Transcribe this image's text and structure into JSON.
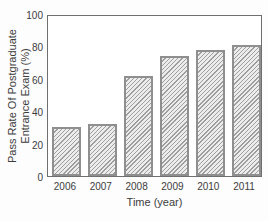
{
  "chart_data": {
    "type": "bar",
    "title": "",
    "categories": [
      "2006",
      "2007",
      "2008",
      "2009",
      "2010",
      "2011"
    ],
    "values": [
      30,
      32,
      62,
      74,
      78,
      81
    ],
    "xlabel": "Time (year)",
    "ylabel_line1": "Pass Rate Of Postgraduate",
    "ylabel_line2": "Entrance Exam (%)",
    "ylim": [
      0,
      100
    ],
    "y_ticks": [
      0,
      20,
      40,
      60,
      80,
      100
    ],
    "grid": "off",
    "legend": "none",
    "bar_hatch": "diagonal-forward",
    "colors": {
      "bar_fill": "#ececec",
      "bar_hatch_line": "#9e9e9e",
      "bar_border": "#8f8f8f",
      "axis_frame": "#6f6f6f",
      "text": "#3c3c3c",
      "background": "#fdfdfd"
    }
  }
}
